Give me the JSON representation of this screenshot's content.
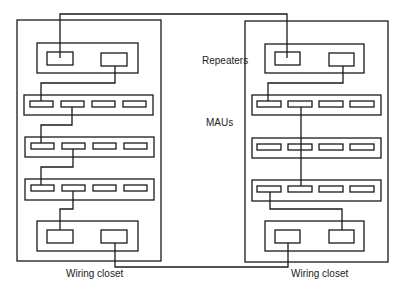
{
  "labels": {
    "repeaters": "Repeaters",
    "maus": "MAUs",
    "left_closet": "Wiring closet",
    "right_closet": "Wiring closet"
  },
  "colors": {
    "stroke": "#1a1a1a",
    "background": "#ffffff"
  }
}
